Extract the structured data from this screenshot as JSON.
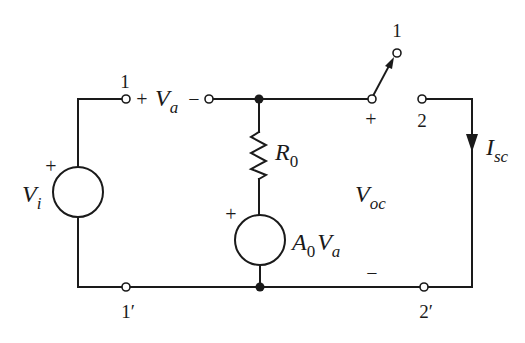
{
  "diagram": {
    "type": "circuit",
    "labels": {
      "terminal_1_input": "1",
      "terminal_1prime": "1′",
      "switch_terminal_1": "1",
      "terminal_2": "2",
      "terminal_2prime": "2′",
      "va_plus": "+",
      "va_minus": "−",
      "va_symbol": "V",
      "va_sub": "a",
      "vi_plus": "+",
      "vi_symbol": "V",
      "vi_sub": "i",
      "r0_symbol": "R",
      "r0_sub": "0",
      "dep_plus": "+",
      "dep_A": "A",
      "dep_A_sub": "0",
      "dep_V": "V",
      "dep_V_sub": "a",
      "voc_plus": "+",
      "voc_minus": "−",
      "voc_symbol": "V",
      "voc_sub": "oc",
      "isc_symbol": "I",
      "isc_sub": "sc"
    },
    "components": [
      {
        "id": "Vi",
        "kind": "independent-voltage-source"
      },
      {
        "id": "R0",
        "kind": "resistor"
      },
      {
        "id": "A0Va",
        "kind": "dependent-voltage-source"
      },
      {
        "id": "S",
        "kind": "switch",
        "positions": [
          "1",
          "2"
        ]
      }
    ],
    "colors": {
      "ink": "#1a1a1a",
      "background": "#ffffff"
    }
  }
}
